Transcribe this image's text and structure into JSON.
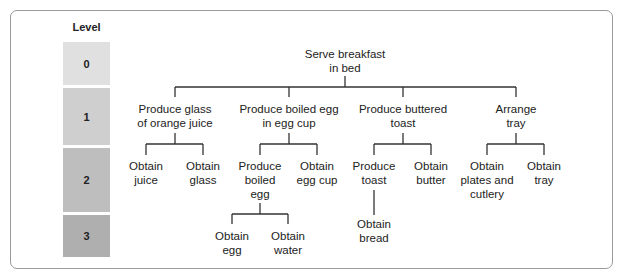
{
  "levels": {
    "title": "Level",
    "items": [
      {
        "label": "0",
        "color": "#e0e0e0"
      },
      {
        "label": "1",
        "color": "#cfcfcf"
      },
      {
        "label": "2",
        "color": "#bebebe"
      },
      {
        "label": "3",
        "color": "#afafaf"
      }
    ]
  },
  "tree": {
    "root": {
      "line1": "Serve breakfast",
      "line2": "in bed"
    },
    "level1": [
      {
        "line1": "Produce glass",
        "line2": "of orange juice"
      },
      {
        "line1": "Produce boiled egg",
        "line2": "in egg cup"
      },
      {
        "line1": "Produce buttered",
        "line2": "toast"
      },
      {
        "line1": "Arrange",
        "line2": "tray"
      }
    ],
    "level2": [
      {
        "line1": "Obtain",
        "line2": "juice"
      },
      {
        "line1": "Obtain",
        "line2": "glass"
      },
      {
        "line1": "Produce",
        "line2": "boiled",
        "line3": "egg"
      },
      {
        "line1": "Obtain",
        "line2": "egg cup"
      },
      {
        "line1": "Produce",
        "line2": "toast"
      },
      {
        "line1": "Obtain",
        "line2": "butter"
      },
      {
        "line1": "Obtain",
        "line2": "plates and",
        "line3": "cutlery"
      },
      {
        "line1": "Obtain",
        "line2": "tray"
      }
    ],
    "level3": [
      {
        "line1": "Obtain",
        "line2": "egg"
      },
      {
        "line1": "Obtain",
        "line2": "water"
      },
      {
        "line1": "Obtain",
        "line2": "bread"
      }
    ]
  }
}
